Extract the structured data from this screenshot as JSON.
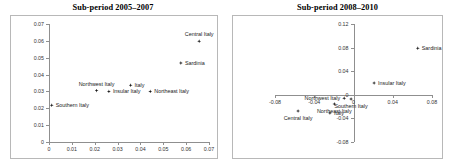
{
  "figure": {
    "width": 449,
    "height": 167,
    "background": "#ffffff",
    "marker_color": "#1a1a1a",
    "axis_color": "#8f8f8f",
    "frame_color": "#b8b8b8"
  },
  "chart_data": [
    {
      "type": "scatter",
      "title": "Sub-period 2005–2007",
      "xlabel": "",
      "ylabel": "",
      "xlim": [
        0,
        0.07
      ],
      "ylim": [
        0,
        0.07
      ],
      "xticks": [
        0,
        0.01,
        0.02,
        0.03,
        0.04,
        0.05,
        0.06,
        0.07
      ],
      "xtick_labels": [
        "0",
        "0.01",
        "0.02",
        "0.03",
        "0.04",
        "0.05",
        "0.06",
        "0.07"
      ],
      "yticks": [
        0,
        0.01,
        0.02,
        0.03,
        0.04,
        0.05,
        0.06,
        0.07
      ],
      "ytick_labels": [
        "0",
        "0.01",
        "0.02",
        "0.03",
        "0.04",
        "0.05",
        "0.06",
        "0.07"
      ],
      "grid": false,
      "legend": "none",
      "points": [
        {
          "label": "Southern Italy",
          "x": 0.0012,
          "y": 0.0218,
          "label_pos": "right"
        },
        {
          "label": "Northwest Italy",
          "x": 0.0208,
          "y": 0.0305,
          "label_pos": "above"
        },
        {
          "label": "Insular Italy",
          "x": 0.0262,
          "y": 0.03,
          "label_pos": "right"
        },
        {
          "label": "Italy",
          "x": 0.0357,
          "y": 0.0337,
          "label_pos": "right"
        },
        {
          "label": "Northeast Italy",
          "x": 0.0443,
          "y": 0.03,
          "label_pos": "right"
        },
        {
          "label": "Sardinia",
          "x": 0.0577,
          "y": 0.0468,
          "label_pos": "right"
        },
        {
          "label": "Central Italy",
          "x": 0.0657,
          "y": 0.0598,
          "label_pos": "above"
        }
      ]
    },
    {
      "type": "scatter",
      "title": "Sub-period 2008–2010",
      "xlabel": "",
      "ylabel": "",
      "xlim": [
        -0.08,
        0.08
      ],
      "ylim": [
        -0.08,
        0.12
      ],
      "xticks": [
        -0.08,
        -0.04,
        0,
        0.04,
        0.08
      ],
      "xtick_labels": [
        "-0.08",
        "-0.04",
        "0",
        "0.04",
        "0.08"
      ],
      "yticks": [
        -0.08,
        -0.04,
        0,
        0.04,
        0.08,
        0.12
      ],
      "ytick_labels": [
        "-0.08",
        "-0.04",
        "0",
        "0.04",
        "0.08",
        "0.12"
      ],
      "grid": false,
      "legend": "none",
      "points": [
        {
          "label": "Sardinia",
          "x": 0.0655,
          "y": 0.079,
          "label_pos": "right"
        },
        {
          "label": "Insular Italy",
          "x": 0.021,
          "y": 0.02,
          "label_pos": "right"
        },
        {
          "label": "Southern Italy",
          "x": -0.0025,
          "y": -0.007,
          "label_pos": "below"
        },
        {
          "label": "Northwest Italy",
          "x": -0.0095,
          "y": -0.006,
          "label_pos": "left"
        },
        {
          "label": "Italy",
          "x": -0.024,
          "y": -0.031,
          "label_pos": "right"
        },
        {
          "label": "Northeast Italy",
          "x": -0.0195,
          "y": -0.0155,
          "label_pos": "below"
        },
        {
          "label": "Central Italy",
          "x": -0.0565,
          "y": -0.0275,
          "label_pos": "below"
        }
      ]
    }
  ]
}
